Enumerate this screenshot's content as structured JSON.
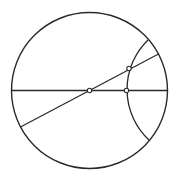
{
  "diagram": {
    "width": 173,
    "height": 176,
    "stroke_color": "#2a2a2a",
    "background": "#ffffff",
    "boundary_circle": {
      "cx": 89.5,
      "cy": 90.5,
      "r": 78
    },
    "horizontal_diameter": {
      "x1": 11.5,
      "y1": 90.5,
      "x2": 167.5,
      "y2": 90.5
    },
    "diagonal_diameter": {
      "x1": 20.5,
      "y1": 127,
      "x2": 158.5,
      "y2": 54
    },
    "geodesic_arc": {
      "start": [
        148,
        40
      ],
      "end": [
        149,
        140
      ],
      "r": 69
    },
    "points": [
      {
        "name": "center-point",
        "x": 89.5,
        "y": 90.5
      },
      {
        "name": "upper-intersection-point",
        "x": 129,
        "y": 68.5
      },
      {
        "name": "lower-intersection-point",
        "x": 126.5,
        "y": 90.5
      }
    ]
  }
}
